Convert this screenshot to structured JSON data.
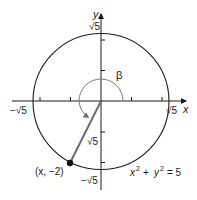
{
  "diagram": {
    "colors": {
      "stroke": "#1a1a1a",
      "arc": "#7a7a7a",
      "terminal_side": "#6a6a6a",
      "background": "#ffffff"
    },
    "axes": {
      "x_label": "x",
      "y_label": "y",
      "x_pos_label": "√5",
      "x_neg_label": "−√5",
      "y_pos_label": "√5",
      "y_neg_label": "−√5"
    },
    "angle": {
      "label": "β"
    },
    "terminal_side": {
      "length_label": "√5"
    },
    "point": {
      "label": "(x, −2)"
    },
    "equation": {
      "lhs_x": "x",
      "lhs_y": "y",
      "exp": "2",
      "plus": "+",
      "rhs": "= 5"
    }
  }
}
